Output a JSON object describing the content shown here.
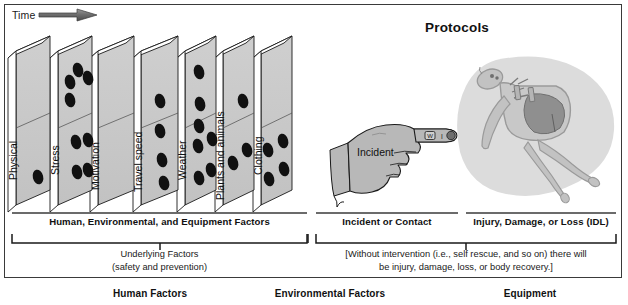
{
  "figure": {
    "time_axis_label": "Time",
    "protocols_title": "Protocols",
    "incident_label": "Incident"
  },
  "panels": [
    {
      "label": "Physical",
      "dots": 1
    },
    {
      "label": "Stress",
      "dots": 8
    },
    {
      "label": "Motivation",
      "dots": 0
    },
    {
      "label": "Travel speed",
      "dots": 4
    },
    {
      "label": "Weather",
      "dots": 7
    },
    {
      "label": "Plants and animals",
      "dots": 3
    },
    {
      "label": "Clothing",
      "dots": 4
    }
  ],
  "sections": [
    {
      "title": "Human, Environmental, and Equipment Factors",
      "note": "Underlying Factors\n(safety and prevention)",
      "note_line1": "Underlying Factors",
      "note_line2": "(safety and prevention)"
    },
    {
      "title": "Incident or Contact",
      "note_line1": "",
      "note_line2": ""
    },
    {
      "title": "Injury, Damage, or Loss (IDL)",
      "note_line1": "[Without intervention (i.e., self rescue, and so on) there will",
      "note_line2": "be injury, damage, loss, or body recovery.]"
    }
  ],
  "bottom_labels": [
    {
      "text": "Human Factors"
    },
    {
      "text": "Environmental Factors"
    },
    {
      "text": "Equipment"
    }
  ],
  "fingertip_marks": [
    "W",
    "I",
    "C"
  ],
  "colors": {
    "panel_face": "#ffffff",
    "panel_side": "#c9c9c9",
    "panel_top": "#ffffff",
    "outline": "#1a1a1a",
    "dot": "#111111",
    "hand_fill": "#b8b8b8",
    "body_halo": "#dcdcdc",
    "body_fill": "#c2c2c2",
    "organ_fill": "#8f8f8f",
    "frame": "#3a3a3a"
  }
}
